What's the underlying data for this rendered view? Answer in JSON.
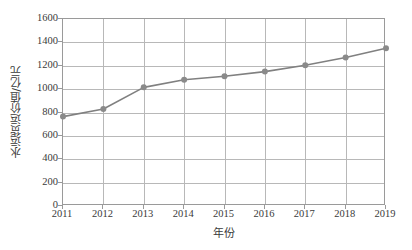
{
  "chart_data": {
    "type": "line",
    "title": "",
    "xlabel": "年份",
    "ylabel": "水运货运价值/亿元",
    "categories": [
      "2011",
      "2012",
      "2013",
      "2014",
      "2015",
      "2016",
      "2017",
      "2018",
      "2019"
    ],
    "values": [
      765,
      830,
      1015,
      1080,
      1110,
      1150,
      1205,
      1270,
      1350
    ],
    "series": [
      {
        "name": "水运货运价值",
        "values": [
          765,
          830,
          1015,
          1080,
          1110,
          1150,
          1205,
          1270,
          1350
        ]
      }
    ],
    "ylim": [
      0,
      1600
    ],
    "ytick_labels": [
      "1600",
      "1400",
      "1200",
      "1000",
      "800",
      "600",
      "400",
      "200",
      "0"
    ],
    "ytick_values": [
      1600,
      1400,
      1200,
      1000,
      800,
      600,
      400,
      200,
      0
    ],
    "grid": true,
    "legend": false,
    "legend_position": "none",
    "line_color": "#808080",
    "marker_color": "#8a8a8a",
    "grid_color": "#b8b8b8",
    "axis_color": "#9a9a9a",
    "background_color": "#ffffff"
  }
}
